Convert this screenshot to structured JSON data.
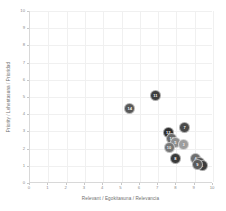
{
  "chart_data": {
    "type": "scatter",
    "title": "",
    "xlabel": "Relevant / Egokitasuna / Relevancia",
    "ylabel": "Priority / Lehentasuna / Prioridad",
    "xlim": [
      0,
      10
    ],
    "ylim": [
      0,
      10
    ],
    "xticks": [
      "0",
      "1",
      "2",
      "3",
      "4",
      "5",
      "6",
      "7",
      "8",
      "9",
      "10"
    ],
    "yticks": [
      "0",
      "1",
      "2",
      "3",
      "4",
      "5",
      "6",
      "7",
      "8",
      "9",
      "10"
    ],
    "grid": true,
    "legend": "none",
    "points": [
      {
        "label": "14",
        "x": 5.45,
        "y": 4.35,
        "color": "#595959",
        "size": 11
      },
      {
        "label": "11",
        "x": 6.85,
        "y": 5.1,
        "color": "#3f3f3f",
        "size": 11
      },
      {
        "label": "7",
        "x": 8.45,
        "y": 3.2,
        "color": "#4a4a4a",
        "size": 11
      },
      {
        "label": "12",
        "x": 7.55,
        "y": 2.95,
        "color": "#2f2f2f",
        "size": 11
      },
      {
        "label": "13",
        "x": 7.75,
        "y": 2.6,
        "color": "#6b6b6b",
        "size": 11
      },
      {
        "label": "5",
        "x": 7.95,
        "y": 2.35,
        "color": "#8f8f8f",
        "size": 11
      },
      {
        "label": "3",
        "x": 8.4,
        "y": 2.25,
        "color": "#9e9e9e",
        "size": 11
      },
      {
        "label": "10",
        "x": 7.6,
        "y": 2.05,
        "color": "#787878",
        "size": 11
      },
      {
        "label": "8",
        "x": 7.95,
        "y": 1.45,
        "color": "#3a3a3a",
        "size": 11
      },
      {
        "label": "4",
        "x": 9.05,
        "y": 1.45,
        "color": "#6f6f6f",
        "size": 11
      },
      {
        "label": "2",
        "x": 9.25,
        "y": 1.2,
        "color": "#4f4f4f",
        "size": 11
      },
      {
        "label": "1",
        "x": 9.4,
        "y": 1.0,
        "color": "#3c3c3c",
        "size": 11
      },
      {
        "label": "9",
        "x": 9.15,
        "y": 1.05,
        "color": "#5c5c5c",
        "size": 11
      }
    ]
  },
  "colors": {
    "axis": "#d8d8d8",
    "grid": "#f0f0f0",
    "tick_text": "#8a8a8a",
    "axis_title": "#6e6e6e",
    "background": "#ffffff"
  }
}
